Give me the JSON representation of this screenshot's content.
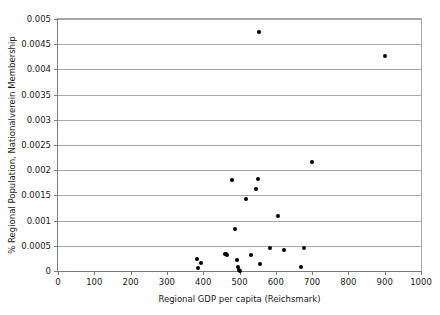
{
  "chart_data": {
    "type": "scatter",
    "title": "",
    "xlabel": "Regional GDP per capita (Reichsmark)",
    "ylabel": "% Regional Population, Nationalverein Membership",
    "xlim": [
      0,
      1000
    ],
    "ylim": [
      0,
      0.005
    ],
    "xticks": [
      0,
      100,
      200,
      300,
      400,
      500,
      600,
      700,
      800,
      900,
      1000
    ],
    "xticklabels": [
      "0",
      "100",
      "200",
      "300",
      "400",
      "500",
      "600",
      "700",
      "800",
      "900",
      "1000"
    ],
    "yticks": [
      0,
      0.0005,
      0.001,
      0.0015,
      0.002,
      0.0025,
      0.003,
      0.0035,
      0.004,
      0.0045,
      0.005
    ],
    "yticklabels": [
      "0",
      "0.0005",
      "0.001",
      "0.0015",
      "0.002",
      "0.0025",
      "0.003",
      "0.0035",
      "0.004",
      "0.0045",
      "0.005"
    ],
    "grid": "horizontal",
    "legend": "none",
    "marker_color": "#000000",
    "gridline_color": "#a8a8a8",
    "axis_color": "#7a7a7a",
    "series": [
      {
        "name": "Regions",
        "points": [
          {
            "x": 384,
            "y": 0.00023
          },
          {
            "x": 386,
            "y": 6e-05
          },
          {
            "x": 394,
            "y": 0.00016
          },
          {
            "x": 459,
            "y": 0.00033
          },
          {
            "x": 462,
            "y": 0.00034
          },
          {
            "x": 465,
            "y": 0.00031
          },
          {
            "x": 478,
            "y": 0.00181
          },
          {
            "x": 487,
            "y": 0.00084
          },
          {
            "x": 492,
            "y": 0.00021
          },
          {
            "x": 497,
            "y": 8e-05
          },
          {
            "x": 499,
            "y": 1e-05
          },
          {
            "x": 501,
            "y": 0.0
          },
          {
            "x": 518,
            "y": 0.00142
          },
          {
            "x": 533,
            "y": 0.00032
          },
          {
            "x": 546,
            "y": 0.00163
          },
          {
            "x": 552,
            "y": 0.00183
          },
          {
            "x": 553,
            "y": 0.00475
          },
          {
            "x": 556,
            "y": 0.00014
          },
          {
            "x": 585,
            "y": 0.00046
          },
          {
            "x": 605,
            "y": 0.0011
          },
          {
            "x": 622,
            "y": 0.00041
          },
          {
            "x": 670,
            "y": 8e-05
          },
          {
            "x": 679,
            "y": 0.00046
          },
          {
            "x": 701,
            "y": 0.00216
          },
          {
            "x": 901,
            "y": 0.00426
          }
        ]
      }
    ]
  }
}
